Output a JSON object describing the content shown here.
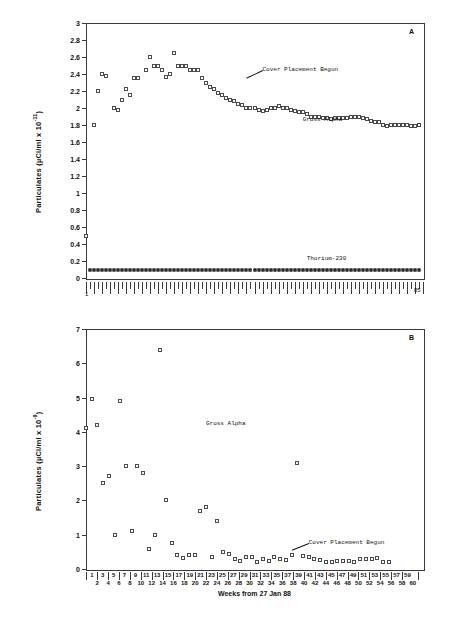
{
  "figure": {
    "caption": ""
  },
  "panels": [
    {
      "letter": "A",
      "ylabel_text": "Particulates (µCi/ml x 10",
      "ylabel_exp": "-11",
      "ylabel_tail": ")",
      "yticks": [
        "0",
        "0.2",
        "0.4",
        "0.6",
        "0.8",
        "1",
        "1.2",
        "1.4",
        "1.6",
        "1.8",
        "2",
        "2.2",
        "2.4",
        "2.6",
        "2.8",
        "3"
      ],
      "x_start_label": "1",
      "x_end_label": "85",
      "annotations": [
        {
          "name": "cover-placement-begun",
          "text": "Cover Placement Begun"
        },
        {
          "name": "gross-alpha",
          "text": "Gross Alpha"
        },
        {
          "name": "thorium-230",
          "text": "Thorium-230"
        }
      ]
    },
    {
      "letter": "B",
      "ylabel_text": "Particulates (µCi/ml x 10",
      "ylabel_exp": "-9",
      "ylabel_tail": ")",
      "yticks": [
        "0",
        "1",
        "2",
        "3",
        "4",
        "5",
        "6",
        "7"
      ],
      "xaxis_title": "Weeks from 27 Jan 88",
      "annotations": [
        {
          "name": "gross-alpha",
          "text": "Gross Alpha"
        },
        {
          "name": "cover-placement-begun",
          "text": "Cover Placement Begun"
        }
      ]
    }
  ],
  "chart_data": [
    {
      "type": "scatter",
      "panel": "A",
      "title": "",
      "xlabel": "",
      "ylabel": "Particulates (µCi/ml x 10^-11)",
      "xlim": [
        1,
        85
      ],
      "ylim": [
        0,
        3
      ],
      "ytick_step": 0.2,
      "grid": false,
      "legend": "none",
      "annotations": [
        {
          "text": "Cover Placement Begun",
          "x": 45,
          "y": 2.44,
          "leader_to": {
            "x": 41,
            "y": 2.35
          }
        },
        {
          "text": "Gross Alpha",
          "x": 55,
          "y": 1.85
        },
        {
          "text": "Thorium-230",
          "x": 56,
          "y": 0.21
        }
      ],
      "series": [
        {
          "name": "Gross Alpha",
          "marker": "open-square",
          "x": [
            1,
            3,
            4,
            5,
            6,
            8,
            9,
            10,
            11,
            12,
            13,
            14,
            16,
            17,
            18,
            19,
            20,
            21,
            22,
            23,
            24,
            25,
            26,
            27,
            28,
            29,
            30,
            31,
            32,
            33,
            34,
            35,
            36,
            37,
            38,
            39,
            40,
            41,
            42,
            43,
            44,
            45,
            46,
            47,
            48,
            49,
            50,
            51,
            52,
            53,
            54,
            55,
            56,
            57,
            58,
            59,
            60,
            61,
            62,
            63,
            64,
            65,
            66,
            67,
            68,
            69,
            70,
            71,
            72,
            73,
            74,
            75,
            76,
            77,
            78,
            79,
            80,
            81,
            82,
            83,
            84
          ],
          "y": [
            0.5,
            1.8,
            2.2,
            2.4,
            2.38,
            2.0,
            1.98,
            2.1,
            2.22,
            2.15,
            2.35,
            2.35,
            2.45,
            2.6,
            2.5,
            2.5,
            2.45,
            2.37,
            2.4,
            2.65,
            2.5,
            2.5,
            2.5,
            2.45,
            2.45,
            2.45,
            2.35,
            2.3,
            2.25,
            2.22,
            2.18,
            2.15,
            2.12,
            2.1,
            2.08,
            2.05,
            2.04,
            2.0,
            2.0,
            2.0,
            1.98,
            1.97,
            1.98,
            2.0,
            2.0,
            2.02,
            2.0,
            2.0,
            1.98,
            1.97,
            1.95,
            1.95,
            1.93,
            1.9,
            1.9,
            1.9,
            1.88,
            1.88,
            1.87,
            1.88,
            1.88,
            1.88,
            1.88,
            1.89,
            1.9,
            1.9,
            1.88,
            1.87,
            1.85,
            1.84,
            1.83,
            1.8,
            1.79,
            1.8,
            1.8,
            1.8,
            1.8,
            1.8,
            1.79,
            1.79,
            1.8
          ]
        },
        {
          "name": "Thorium-230",
          "marker": "filled-square",
          "constant_y": 0.1,
          "x_from": 2,
          "x_to": 84,
          "n_points": 83
        }
      ]
    },
    {
      "type": "scatter",
      "panel": "B",
      "title": "",
      "xlabel": "Weeks from 27 Jan 88",
      "ylabel": "Particulates (µCi/ml x 10^-9)",
      "xlim": [
        1,
        60
      ],
      "ylim": [
        0,
        7
      ],
      "ytick_step": 1,
      "grid": false,
      "legend": "none",
      "annotations": [
        {
          "text": "Gross Alpha",
          "x": 22,
          "y": 4.2
        },
        {
          "text": "Cover Placement Begun",
          "x": 40,
          "y": 0.72,
          "leader_to": {
            "x": 37,
            "y": 0.52
          }
        }
      ],
      "series": [
        {
          "name": "Gross Alpha",
          "marker": "open-square",
          "x": [
            1,
            2,
            3,
            4,
            5,
            6,
            7,
            8,
            9,
            10,
            11,
            12,
            13,
            14,
            15,
            16,
            17,
            18,
            19,
            20,
            21,
            22,
            23,
            24,
            25,
            26,
            27,
            28,
            29,
            30,
            31,
            32,
            33,
            34,
            35,
            36,
            37,
            38,
            39,
            40,
            41,
            42,
            43,
            44,
            45,
            46,
            47,
            48,
            49,
            50,
            51,
            52,
            53,
            54
          ],
          "y": [
            4.1,
            4.95,
            4.2,
            2.5,
            2.7,
            1.0,
            4.9,
            3.0,
            1.1,
            3.0,
            2.8,
            0.57,
            1.0,
            6.4,
            2.0,
            0.75,
            0.4,
            0.33,
            0.4,
            0.4,
            1.7,
            1.8,
            0.35,
            1.4,
            0.5,
            0.45,
            0.3,
            0.22,
            0.35,
            0.35,
            0.2,
            0.28,
            0.22,
            0.35,
            0.3,
            0.27,
            0.4,
            3.1,
            0.38,
            0.35,
            0.3,
            0.25,
            0.2,
            0.2,
            0.22,
            0.22,
            0.22,
            0.2,
            0.3,
            0.3,
            0.3,
            0.32,
            0.2,
            0.2
          ]
        }
      ]
    }
  ]
}
